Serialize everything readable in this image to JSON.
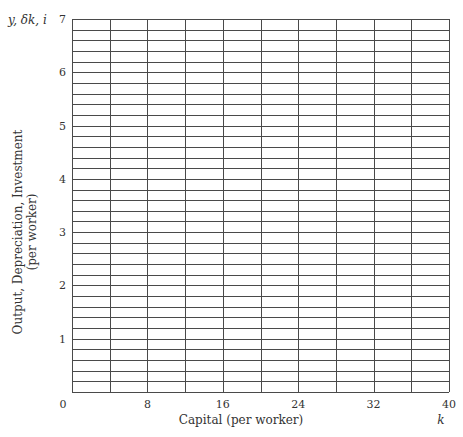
{
  "chart_data": {
    "type": "line",
    "title": "",
    "xlabel": "Capital (per worker)",
    "xlabel_symbol": "k",
    "ylabel": "Output, Depreciation, Investment",
    "ylabel_sub": "(per worker)",
    "ylabel_symbol": "y, δk, i",
    "x_ticks": [
      "0",
      "8",
      "16",
      "24",
      "32",
      "40"
    ],
    "y_ticks": [
      "1",
      "2",
      "3",
      "4",
      "5",
      "6",
      "7"
    ],
    "xlim": [
      0,
      40
    ],
    "ylim": [
      0,
      7
    ],
    "grid": true,
    "x_grid_step": 4,
    "y_grid_step": 0.2,
    "series": [],
    "note": "Blank graph grid (no plotted data)"
  }
}
